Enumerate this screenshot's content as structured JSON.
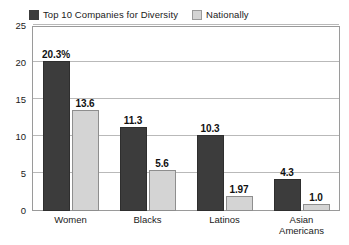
{
  "chart_data": {
    "type": "bar",
    "title": "",
    "xlabel": "",
    "ylabel": "",
    "ylim": [
      0,
      25
    ],
    "yticks": [
      0,
      5,
      10,
      15,
      20,
      25
    ],
    "ytick_labels": [
      "0",
      "5",
      "10",
      "15",
      "20",
      "25"
    ],
    "grid": true,
    "legend_position": "top-left",
    "categories": [
      "Women",
      "Blacks",
      "Latinos",
      "Asian\nAmericans"
    ],
    "series": [
      {
        "name": "Top 10 Companies for Diversity",
        "color": "#3c3c3c",
        "values": [
          20.3,
          11.3,
          10.3,
          4.3
        ],
        "labels": [
          "20.3%",
          "11.3",
          "10.3",
          "4.3"
        ]
      },
      {
        "name": "Nationally",
        "color": "#d4d4d4",
        "values": [
          13.6,
          5.6,
          1.97,
          1.0
        ],
        "labels": [
          "13.6",
          "5.6",
          "1.97",
          "1.0"
        ]
      }
    ]
  },
  "legend": {
    "items": [
      {
        "label": "Top 10 Companies for Diversity",
        "color": "#3c3c3c"
      },
      {
        "label": "Nationally",
        "color": "#d4d4d4"
      }
    ]
  },
  "axis": {
    "y_ticks": [
      {
        "label": "25"
      },
      {
        "label": "20"
      },
      {
        "label": "15"
      },
      {
        "label": "10"
      },
      {
        "label": "5"
      },
      {
        "label": "0"
      }
    ],
    "x_labels": [
      {
        "label": "Women"
      },
      {
        "label": "Blacks"
      },
      {
        "label": "Latinos"
      },
      {
        "label": "Asian\nAmericans"
      }
    ]
  },
  "colors": {
    "series_dark": "#3c3c3c",
    "series_light": "#d4d4d4",
    "gridline": "#b9b9b9",
    "frame": "#9a9a9a",
    "background": "#ffffff"
  }
}
